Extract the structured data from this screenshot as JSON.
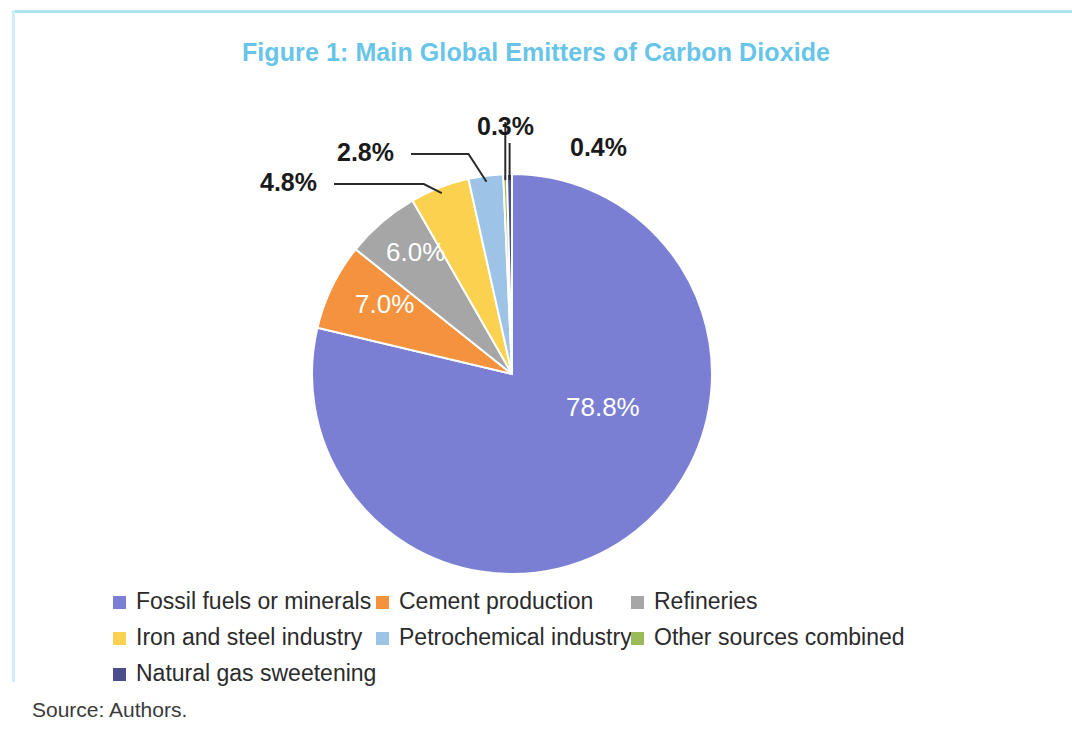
{
  "figure": {
    "title": "Figure 1: Main Global Emitters of Carbon Dioxide",
    "title_color": "#68c5e8",
    "source": "Source: Authors.",
    "frame_color": "#aee3f2"
  },
  "chart_data": {
    "type": "pie",
    "title": "Figure 1: Main Global Emitters of Carbon Dioxide",
    "xlabel": "",
    "ylabel": "",
    "legend_position": "bottom",
    "grid": false,
    "unit": "%",
    "categories": [
      "Fossil fuels or minerals",
      "Cement production",
      "Refineries",
      "Iron and steel industry",
      "Petrochemical industry",
      "Other sources combined",
      "Natural gas sweetening"
    ],
    "values": [
      78.8,
      7.0,
      6.0,
      4.8,
      2.8,
      0.3,
      0.4
    ],
    "labels": [
      "78.8%",
      "7.0%",
      "6.0%",
      "4.8%",
      "2.8%",
      "0.3%",
      "0.4%"
    ],
    "colors": [
      "#7b7fd4",
      "#f5923e",
      "#a6a6a6",
      "#fad24f",
      "#9dc3e6",
      "#9bbb59",
      "#4a4e8c"
    ],
    "slices": [
      {
        "name": "Fossil fuels or minerals",
        "value": 78.8,
        "label": "78.8%",
        "color": "#7b7fd4",
        "label_placement": "inside",
        "label_x": 566,
        "label_y": 392
      },
      {
        "name": "Cement production",
        "value": 7.0,
        "label": "7.0%",
        "color": "#f5923e",
        "label_placement": "inside",
        "label_x": 355,
        "label_y": 289
      },
      {
        "name": "Refineries",
        "value": 6.0,
        "label": "6.0%",
        "color": "#a6a6a6",
        "label_placement": "inside",
        "label_x": 386,
        "label_y": 237
      },
      {
        "name": "Iron and steel industry",
        "value": 4.8,
        "label": "4.8%",
        "color": "#fad24f",
        "label_placement": "leader",
        "label_x": 260,
        "label_y": 168
      },
      {
        "name": "Petrochemical industry",
        "value": 2.8,
        "label": "2.8%",
        "color": "#9dc3e6",
        "label_placement": "leader",
        "label_x": 337,
        "label_y": 138
      },
      {
        "name": "Other sources combined",
        "value": 0.3,
        "label": "0.3%",
        "color": "#9bbb59",
        "label_placement": "leader",
        "label_x": 477,
        "label_y": 112
      },
      {
        "name": "Natural gas sweetening",
        "value": 0.4,
        "label": "0.4%",
        "color": "#4a4e8c",
        "label_placement": "leader",
        "label_x": 570,
        "label_y": 133
      }
    ]
  },
  "legend": {
    "rows": [
      [
        {
          "label": "Fossil fuels or minerals",
          "color": "#7b7fd4"
        },
        {
          "label": "Cement production",
          "color": "#f5923e"
        },
        {
          "label": "Refineries",
          "color": "#a6a6a6"
        }
      ],
      [
        {
          "label": "Iron and steel industry",
          "color": "#fad24f"
        },
        {
          "label": "Petrochemical industry",
          "color": "#9dc3e6"
        },
        {
          "label": "Other sources combined",
          "color": "#9bbb59"
        }
      ],
      [
        {
          "label": "Natural gas sweetening",
          "color": "#4a4e8c"
        }
      ]
    ]
  }
}
